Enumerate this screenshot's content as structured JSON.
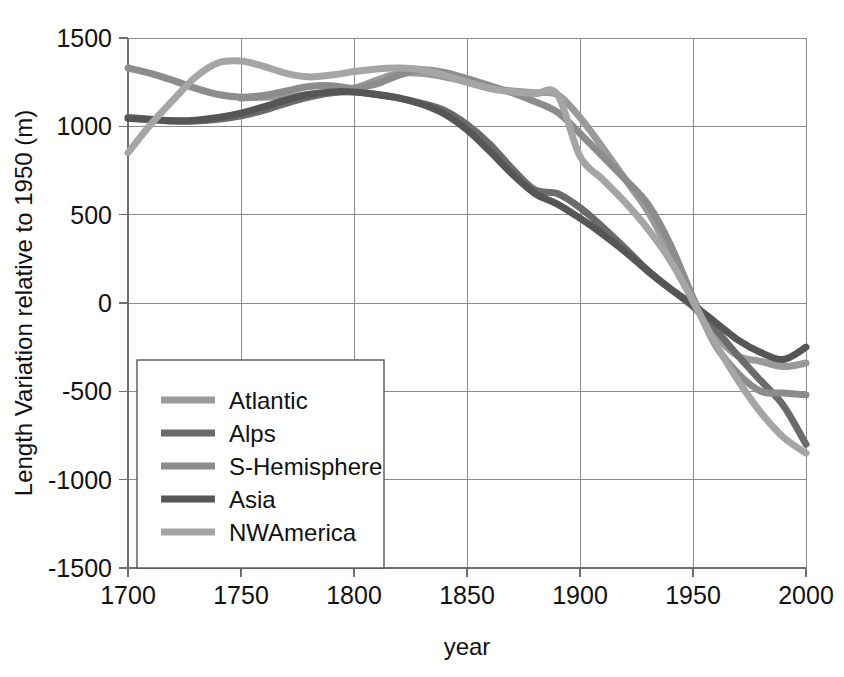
{
  "chart_data": {
    "type": "line",
    "title": "",
    "xlabel": "year",
    "ylabel": "Length Variation relative to 1950 (m)",
    "xlim": [
      1700,
      2000
    ],
    "ylim": [
      -1500,
      1500
    ],
    "xticks": [
      "1700",
      "1750",
      "1800",
      "1850",
      "1900",
      "1950",
      "2000"
    ],
    "yticks": [
      "1500",
      "1000",
      "500",
      "0",
      "-500",
      "-1000",
      "-1500"
    ],
    "grid": true,
    "legend_position": "lower-left-inside",
    "x": [
      1700,
      1710,
      1720,
      1730,
      1740,
      1750,
      1760,
      1770,
      1780,
      1790,
      1800,
      1810,
      1820,
      1830,
      1840,
      1850,
      1860,
      1870,
      1880,
      1890,
      1900,
      1910,
      1920,
      1930,
      1940,
      1950,
      1960,
      1970,
      1980,
      1990,
      2000
    ],
    "series": [
      {
        "name": "Atlantic",
        "color": "#9a9a9a",
        "values": [
          null,
          null,
          null,
          null,
          null,
          1160,
          1165,
          1170,
          1180,
          1190,
          1215,
          1260,
          1300,
          1300,
          1280,
          1250,
          1215,
          1200,
          1190,
          1180,
          1050,
          880,
          700,
          520,
          280,
          20,
          -180,
          -300,
          -330,
          -360,
          -340
        ]
      },
      {
        "name": "Alps",
        "color": "#6b6b6b",
        "values": [
          1050,
          1040,
          1030,
          1030,
          1040,
          1060,
          1090,
          1130,
          1165,
          1190,
          1195,
          1180,
          1160,
          1130,
          1090,
          1010,
          900,
          760,
          640,
          620,
          540,
          430,
          310,
          185,
          80,
          -20,
          -150,
          -300,
          -440,
          -580,
          -800
        ]
      },
      {
        "name": "S-Hemisphere",
        "color": "#8c8c8c",
        "values": [
          1330,
          1300,
          1260,
          1215,
          1180,
          1165,
          1175,
          1200,
          1225,
          1230,
          1215,
          1240,
          1290,
          1320,
          1305,
          1270,
          1230,
          1190,
          1140,
          1080,
          960,
          830,
          700,
          560,
          330,
          30,
          -240,
          -400,
          -500,
          -510,
          -520
        ]
      },
      {
        "name": "Asia",
        "color": "#565656",
        "values": [
          1045,
          1038,
          1032,
          1035,
          1050,
          1075,
          1110,
          1150,
          1180,
          1195,
          1195,
          1180,
          1160,
          1125,
          1070,
          980,
          860,
          730,
          620,
          560,
          480,
          390,
          290,
          180,
          80,
          -10,
          -110,
          -210,
          -280,
          -320,
          -250
        ]
      },
      {
        "name": "NWAmerica",
        "color": "#a5a5a5",
        "values": [
          850,
          1010,
          1150,
          1280,
          1360,
          1370,
          1340,
          1300,
          1280,
          1290,
          1310,
          1325,
          1330,
          1320,
          1290,
          1250,
          1215,
          1195,
          1185,
          1180,
          830,
          700,
          570,
          420,
          240,
          10,
          -230,
          -440,
          -620,
          -760,
          -850
        ]
      }
    ]
  },
  "legend": {
    "entries": [
      {
        "label": "Atlantic"
      },
      {
        "label": "Alps"
      },
      {
        "label": "S-Hemisphere"
      },
      {
        "label": "Asia"
      },
      {
        "label": "NWAmerica"
      }
    ]
  }
}
